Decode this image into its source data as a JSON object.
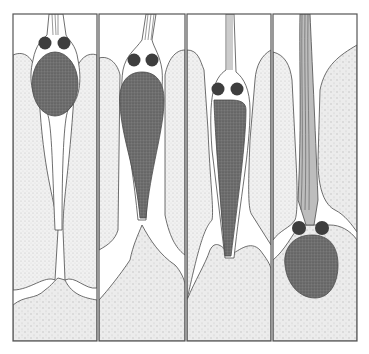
{
  "figure": {
    "type": "scientific-illustration",
    "panel_count": 4,
    "panels": [
      {
        "index": 1,
        "stage": "soma-in-upper-region-with-trailing-process"
      },
      {
        "index": 2,
        "stage": "soma-elongating-downward"
      },
      {
        "index": 3,
        "stage": "elongated-leading-process-descending"
      },
      {
        "index": 4,
        "stage": "soma-arrived-at-lower-zone-with-fiber-bundle-above"
      }
    ],
    "colors": {
      "frame": "#555555",
      "background": "#ffffff",
      "stipple_tissue": "#e8e8e8",
      "dense_tissue": "#dcdcdc",
      "nucleus": "#6a6a6a",
      "nucleolus": "#3a3a3a",
      "outline": "#4a4a4a"
    }
  }
}
